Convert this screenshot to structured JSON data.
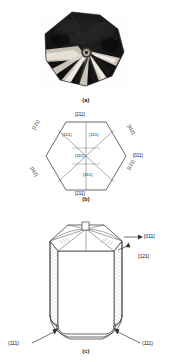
{
  "figure": {
    "panels": [
      {
        "id": "a",
        "caption": "(a)",
        "kind": "micrograph",
        "description": "dark heptagonal crystal cross-section with bright radial striations"
      },
      {
        "id": "b",
        "caption": "(b)",
        "kind": "hexagonal-sector-diagram",
        "outer_labels": {
          "top": "[211]",
          "top_left": "[121]",
          "top_right": "[112]",
          "right": "[011]",
          "bottom_right": "[121]",
          "bottom_left": "[112]",
          "bottom": "[211]"
        },
        "sector_labels": [
          "(111)",
          "(111)",
          "(111)",
          "(111)",
          "(111)"
        ]
      },
      {
        "id": "c",
        "caption": "(c)",
        "kind": "prism-3d-diagram",
        "callouts": {
          "top_right": "[011]",
          "mid_right": "[121]",
          "bottom_left": "(111)",
          "bottom_right": "(111)"
        }
      }
    ]
  },
  "colors": {
    "ink": "#111111",
    "line": "#3a3a3a",
    "hatch": "#8a8a8a",
    "background": "#ffffff",
    "crystal_dark": "#141414",
    "crystal_light": "#d8d4cc"
  }
}
